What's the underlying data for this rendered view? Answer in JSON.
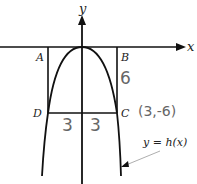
{
  "diagram": {
    "axes": {
      "x_label": "x",
      "y_label": "y"
    },
    "points": {
      "A": "A",
      "B": "B",
      "C": "C",
      "D": "D"
    },
    "curve_label": "y = h(x)",
    "annotations": {
      "height_BC": "6",
      "half_width_left": "3",
      "half_width_right": "3",
      "point_C_coords": "(3,-6)"
    },
    "colors": {
      "line": "#111111",
      "handwriting": "#6a6a6a",
      "pointer": "#999999"
    }
  }
}
